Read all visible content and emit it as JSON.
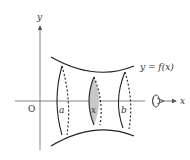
{
  "diagram": {
    "type": "solid-of-revolution",
    "axes": {
      "x_label": "x",
      "y_label": "y",
      "origin_label": "O"
    },
    "curve_label": "y = f(x)",
    "points": {
      "a": "a",
      "x": "x",
      "b": "b"
    },
    "cross_section_fill": "#c8c8c8",
    "line_color": "#222222",
    "axis_color": "#555555",
    "rotation_indicator": "rotation-around-x-axis"
  }
}
